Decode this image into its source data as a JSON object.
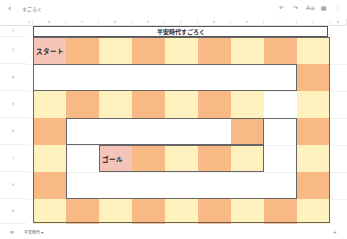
{
  "app": {
    "title": "すごろく",
    "back_icon": "‹",
    "toolbar_icons": [
      {
        "name": "undo-icon",
        "glyph": "↶"
      },
      {
        "name": "redo-icon",
        "glyph": "↷"
      },
      {
        "name": "text-format-icon",
        "glyph": "A≡"
      },
      {
        "name": "grid-icon",
        "glyph": "▦"
      },
      {
        "name": "more-icon",
        "glyph": "⋮"
      }
    ]
  },
  "sheet": {
    "columns": [
      "A",
      "B",
      "C",
      "D",
      "E",
      "F",
      "G",
      "H",
      "I",
      "J",
      "K"
    ],
    "rows": [
      "2",
      "3",
      "4",
      "5",
      "6",
      "7",
      "8",
      "9"
    ],
    "title": "平安時代すごろく",
    "start_label": "スタート",
    "goal_label": "ゴール",
    "colors": {
      "orange": "#F9B984",
      "yellow": "#FDF2BD",
      "pink": "#F5C4B8",
      "border": "#555555"
    },
    "board": [
      [
        "p",
        "o",
        "y",
        "o",
        "y",
        "o",
        "y",
        "o",
        "y"
      ],
      [
        "",
        "",
        "",
        "",
        "",
        "",
        "",
        "",
        "o"
      ],
      [
        "y",
        "o",
        "y",
        "o",
        "y",
        "o",
        "y",
        "",
        "y"
      ],
      [
        "o",
        "",
        "",
        "",
        "",
        "",
        "o",
        "",
        "o"
      ],
      [
        "y",
        "",
        "p",
        "o",
        "y",
        "o",
        "y",
        "",
        "y"
      ],
      [
        "o",
        "",
        "",
        "",
        "",
        "",
        "",
        "",
        "o"
      ],
      [
        "y",
        "o",
        "y",
        "o",
        "y",
        "o",
        "y",
        "o",
        "y"
      ]
    ]
  },
  "bottom": {
    "sheets_icon": "≡",
    "tab_label": "平安時代 ▾",
    "add_icon": "+"
  }
}
